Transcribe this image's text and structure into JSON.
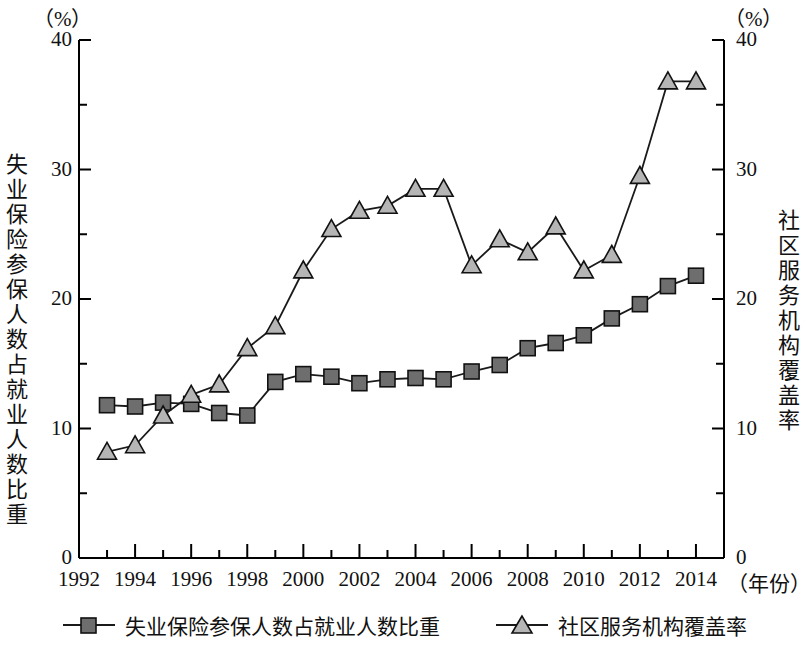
{
  "figure": {
    "unit_left": "（%）",
    "unit_right": "（%）",
    "axis_title_left": "失业保险参保人数占就业人数比重",
    "axis_title_right": "社区服务机构覆盖率",
    "xaxis_caption": "（年份）"
  },
  "legend": {
    "items": [
      {
        "label": "失业保险参保人数占就业人数比重",
        "marker": "square-marker",
        "color": "#6e6e6e"
      },
      {
        "label": "社区服务机构覆盖率",
        "marker": "triangle-marker",
        "color": "#b5b5b5"
      }
    ]
  },
  "chart_data": {
    "type": "line",
    "title": "",
    "xlabel": "（年份）",
    "ylabel": "失业保险参保人数占就业人数比重",
    "y2label": "社区服务机构覆盖率",
    "unit": "%",
    "grid": false,
    "legend_position": "bottom",
    "xlim": [
      1992,
      2015
    ],
    "ylim": [
      0,
      40
    ],
    "y2lim": [
      0,
      40
    ],
    "yticks": [
      0,
      10,
      20,
      30,
      40
    ],
    "y2ticks": [
      0,
      10,
      20,
      30,
      40
    ],
    "minor_ytick_step": 5,
    "xticks": [
      1992,
      1994,
      1996,
      1998,
      2000,
      2002,
      2004,
      2006,
      2008,
      2010,
      2012,
      2014
    ],
    "minor_xtick_step": 1,
    "x": [
      1993,
      1994,
      1995,
      1996,
      1997,
      1998,
      1999,
      2000,
      2001,
      2002,
      2003,
      2004,
      2005,
      2006,
      2007,
      2008,
      2009,
      2010,
      2011,
      2012,
      2013,
      2014
    ],
    "series": [
      {
        "name": "失业保险参保人数占就业人数比重",
        "axis": "left",
        "marker": "square",
        "color": "#6e6e6e",
        "values": [
          11.8,
          11.7,
          12.0,
          11.9,
          11.2,
          11.0,
          13.6,
          14.2,
          14.0,
          13.5,
          13.8,
          13.9,
          13.8,
          14.4,
          14.9,
          16.2,
          16.6,
          17.2,
          18.5,
          19.6,
          21.0,
          21.8
        ]
      },
      {
        "name": "社区服务机构覆盖率",
        "axis": "right",
        "marker": "triangle",
        "color": "#b5b5b5",
        "values": [
          8.2,
          8.7,
          11.0,
          12.6,
          13.4,
          16.2,
          17.9,
          22.2,
          25.4,
          26.8,
          27.2,
          28.5,
          28.5,
          22.6,
          24.6,
          23.6,
          25.6,
          22.2,
          23.4,
          29.5,
          36.8,
          36.8
        ]
      }
    ]
  }
}
